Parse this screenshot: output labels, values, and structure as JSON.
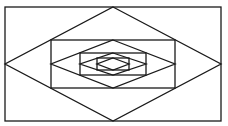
{
  "diagram": {
    "stroke_color": "#1a1a1a",
    "background": "#ffffff",
    "levels": [
      {
        "rect": {
          "x": 5,
          "y": 7,
          "w": 216,
          "h": 114
        }
      },
      {
        "rect": {
          "x": 51,
          "y": 40,
          "w": 124,
          "h": 48
        }
      },
      {
        "rect": {
          "x": 80,
          "y": 53,
          "w": 66,
          "h": 22
        }
      },
      {
        "rect": {
          "x": 97,
          "y": 58,
          "w": 32,
          "h": 12
        }
      }
    ]
  }
}
